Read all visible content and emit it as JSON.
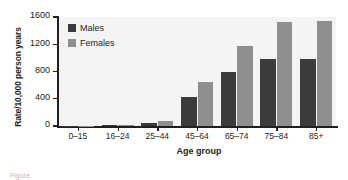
{
  "chart_data": {
    "type": "bar",
    "title": "",
    "xlabel": "Age group",
    "ylabel": "Rate/10,000 person years",
    "categories": [
      "0–15",
      "16–24",
      "25–44",
      "45–64",
      "65–74",
      "75–84",
      "85+"
    ],
    "series": [
      {
        "name": "Males",
        "color": "#3b3b3b",
        "values": [
          5,
          10,
          40,
          430,
          800,
          980,
          980
        ]
      },
      {
        "name": "Females",
        "color": "#8f8f8f",
        "values": [
          5,
          12,
          75,
          640,
          1180,
          1530,
          1540
        ]
      }
    ],
    "ylim": [
      0,
      1600
    ],
    "yticks": [
      0,
      400,
      800,
      1200,
      1600
    ],
    "ytick_labels": [
      "0",
      "400",
      "800",
      "1200",
      "1600"
    ],
    "grid": false,
    "legend_position": "top-left",
    "plot_background": "#f4f4f4"
  },
  "caption": {
    "text": "Figure"
  }
}
